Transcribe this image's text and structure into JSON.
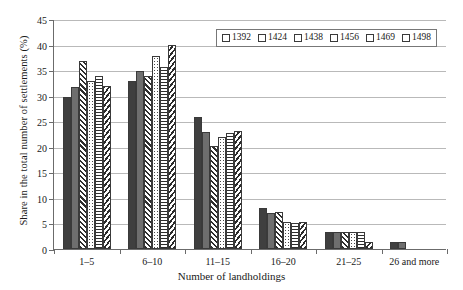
{
  "chart_data": {
    "type": "bar",
    "title": "",
    "xlabel": "Number of landholdings",
    "ylabel": "Share in the total number of settlements (%)",
    "categories": [
      "1–5",
      "6–10",
      "11–15",
      "16–20",
      "21–25",
      "26 and more"
    ],
    "ylim": [
      0,
      45
    ],
    "yticks": [
      0,
      5,
      10,
      15,
      20,
      25,
      30,
      35,
      40,
      45
    ],
    "grid": true,
    "legend_position": "top-right",
    "series": [
      {
        "name": "1392",
        "pattern": "solid-dark",
        "values": [
          29.8,
          32.8,
          25.9,
          8.1,
          3.3,
          1.4
        ]
      },
      {
        "name": "1424",
        "pattern": "solid-gray",
        "values": [
          31.7,
          34.8,
          22.8,
          7.1,
          3.3,
          1.3
        ]
      },
      {
        "name": "1438",
        "pattern": "diagonal-hatch",
        "values": [
          36.7,
          33.9,
          20.1,
          7.2,
          3.3,
          0.0
        ]
      },
      {
        "name": "1456",
        "pattern": "dotted",
        "values": [
          32.8,
          37.7,
          21.9,
          5.2,
          3.3,
          0.0
        ]
      },
      {
        "name": "1469",
        "pattern": "horizontal-lines",
        "values": [
          33.9,
          35.6,
          22.7,
          5.1,
          3.3,
          0.0
        ]
      },
      {
        "name": "1498",
        "pattern": "diagonal-hatch-alt",
        "values": [
          31.9,
          39.9,
          23.0,
          5.2,
          1.3,
          0.0
        ]
      }
    ]
  },
  "legend": {
    "entries": [
      "1392",
      "1424",
      "1438",
      "1456",
      "1469",
      "1498"
    ]
  },
  "axes": {
    "y_tick_labels": [
      "0",
      "5",
      "10",
      "15",
      "20",
      "25",
      "30",
      "35",
      "40",
      "45"
    ],
    "x_tick_labels": [
      "1–5",
      "6–10",
      "11–15",
      "16–20",
      "21–25",
      "26 and more"
    ],
    "y_title": "Share in the total number of settlements (%)",
    "x_title": "Number of landholdings"
  },
  "colors": {
    "series_dark": "#3f3f3f",
    "series_gray": "#6e6e6e",
    "gridline": "#b9b9b9",
    "axis": "#6b6b6b"
  }
}
